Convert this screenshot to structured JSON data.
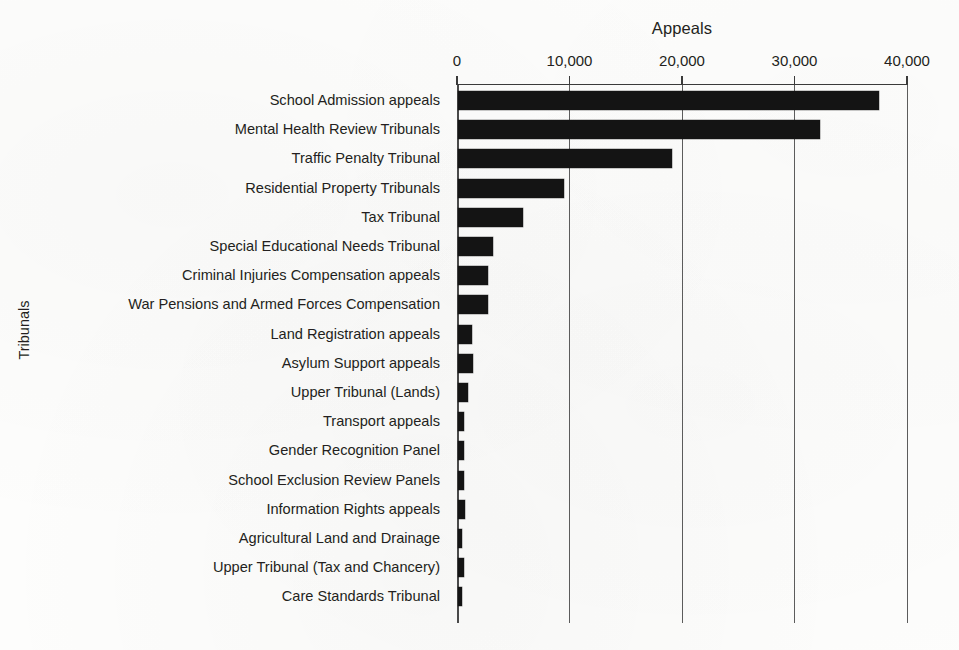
{
  "chart_data": {
    "type": "bar",
    "orientation": "horizontal",
    "title": "Appeals",
    "xlabel": "Appeals",
    "ylabel": "Tribunals",
    "xlim": [
      0,
      40000
    ],
    "grid": true,
    "legend": null,
    "x_ticks": [
      {
        "value": 0,
        "label": "0"
      },
      {
        "value": 10000,
        "label": "10,000"
      },
      {
        "value": 20000,
        "label": "20,000"
      },
      {
        "value": 30000,
        "label": "30,000"
      },
      {
        "value": 40000,
        "label": "40,000"
      }
    ],
    "categories": [
      "School Admission appeals",
      "Mental Health Review Tribunals",
      "Traffic Penalty Tribunal",
      "Residential Property Tribunals",
      "Tax Tribunal",
      "Special Educational Needs Tribunal",
      "Criminal Injuries Compensation appeals",
      "War Pensions and Armed Forces Compensation",
      "Land Registration appeals",
      "Asylum Support appeals",
      "Upper Tribunal (Lands)",
      "Transport appeals",
      "Gender Recognition Panel",
      "School Exclusion Review Panels",
      "Information Rights appeals",
      "Agricultural Land and Drainage",
      "Upper Tribunal (Tax and Chancery)",
      "Care Standards Tribunal"
    ],
    "values": [
      37400,
      32200,
      19000,
      9400,
      5800,
      3100,
      2700,
      2700,
      1250,
      1300,
      900,
      550,
      500,
      500,
      600,
      350,
      550,
      300
    ],
    "colors": {
      "bar": "#141414",
      "gridline": "#5c5c5c",
      "axis": "#3a3a3a",
      "text": "#231f20",
      "background": "#fdfdfc"
    }
  }
}
